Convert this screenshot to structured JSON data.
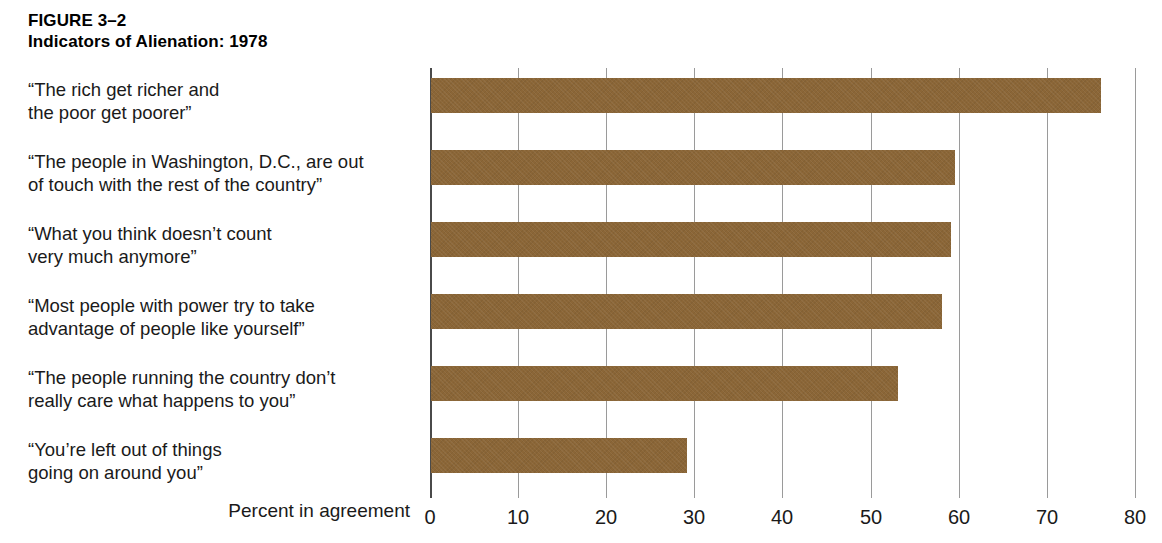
{
  "figure": {
    "number": "FIGURE 3–2",
    "title": "Indicators of Alienation: 1978"
  },
  "chart_data": {
    "type": "bar",
    "orientation": "horizontal",
    "title": "Indicators of Alienation: 1978",
    "subtitle": "",
    "xlabel": "Percent in agreement",
    "ylabel": "",
    "xlim": [
      0,
      80
    ],
    "xticks": [
      0,
      10,
      20,
      30,
      40,
      50,
      60,
      70,
      80
    ],
    "xtick_labels": [
      "0",
      "10",
      "20",
      "30",
      "40",
      "50",
      "60",
      "70",
      "80"
    ],
    "grid": true,
    "grid_axis": "x",
    "legend": false,
    "bar_color": "#8b6637",
    "categories": [
      "“The rich get richer and\nthe poor get poorer”",
      "“The people in Washington, D.C., are out\nof touch with the rest of the country”",
      "“What you think doesn’t count\nvery much anymore”",
      "“Most people with power try to take\nadvantage of people like yourself”",
      "“The people running the country don’t\nreally care what happens to you”",
      "“You’re left out of things\ngoing on around you”"
    ],
    "values": [
      76,
      59.5,
      59,
      58,
      53,
      29
    ]
  }
}
